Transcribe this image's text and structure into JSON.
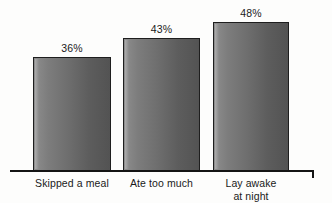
{
  "chart_data": {
    "type": "bar",
    "title": "",
    "subtitle": "",
    "xlabel": "",
    "ylabel": "",
    "categories": [
      "Skipped a meal",
      "Ate too much",
      "Lay awake\nat night"
    ],
    "values": [
      36,
      43,
      48
    ],
    "value_labels": [
      "36%",
      "43%",
      "48%"
    ],
    "ylim": [
      0,
      60
    ],
    "grid": false,
    "legend": false,
    "legend_position": "none",
    "series": [
      {
        "name": "",
        "values": [
          36,
          43,
          48
        ]
      }
    ],
    "annotations": []
  },
  "axis": {
    "baseline_name": "x-axis",
    "right_tick_name": "axis-end-tick"
  },
  "colors": {
    "bar_light": "#8e8e8e",
    "bar_dark": "#535353",
    "bar_border": "#1e1e1e",
    "axis": "#141414",
    "text": "#1a1a1a",
    "background": "#fdfdfc"
  },
  "geometry": {
    "bars": [
      {
        "left": 33,
        "top": 57,
        "width": 78,
        "height": 114
      },
      {
        "left": 123,
        "top": 38,
        "width": 77,
        "height": 133
      },
      {
        "left": 213,
        "top": 22,
        "width": 76,
        "height": 149
      }
    ],
    "value_labels": [
      {
        "left": 33,
        "top": 42,
        "width": 78
      },
      {
        "left": 123,
        "top": 23,
        "width": 77
      },
      {
        "left": 213,
        "top": 7,
        "width": 76
      }
    ],
    "cat_labels": [
      {
        "left": 21,
        "top": 177,
        "width": 102
      },
      {
        "left": 112,
        "top": 177,
        "width": 99
      },
      {
        "left": 203,
        "top": 177,
        "width": 96
      }
    ]
  }
}
